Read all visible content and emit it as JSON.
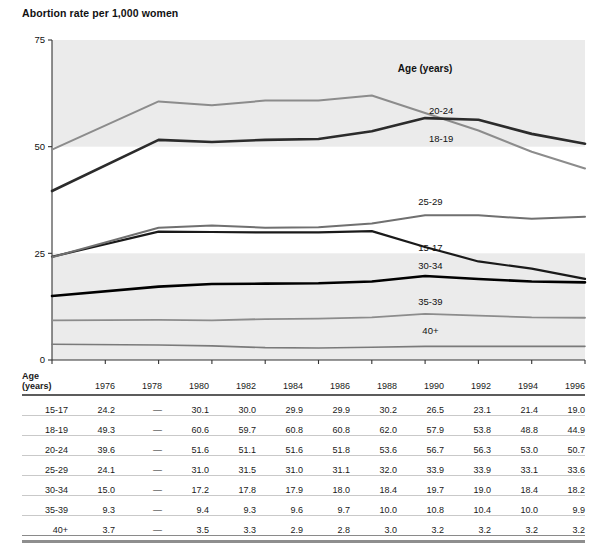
{
  "chart_data": {
    "type": "line",
    "title": "Abortion rate per 1,000 women",
    "xlabel": "",
    "ylabel": "",
    "ylim": [
      0,
      75
    ],
    "yticks": [
      0,
      25,
      50,
      75
    ],
    "grid": false,
    "bands": "alternating light-gray horizontal bands between y=0-25 and y=50-75",
    "legend_position": "inline-right",
    "legend_title": "Age (years)",
    "x": [
      1976,
      1978,
      1980,
      1982,
      1984,
      1986,
      1988,
      1990,
      1992,
      1994,
      1996
    ],
    "xticklabels": [
      "1976",
      "1978",
      "1980",
      "1982",
      "1984",
      "1986",
      "1988",
      "1990",
      "1992",
      "1994",
      "1996"
    ],
    "series": [
      {
        "name": "15-17",
        "color": "#1a1a1a",
        "width": 2.2,
        "values": [
          24.2,
          null,
          30.1,
          30.0,
          29.9,
          29.9,
          30.2,
          26.5,
          23.1,
          21.4,
          19.0
        ]
      },
      {
        "name": "18-19",
        "color": "#8c8c8c",
        "width": 2.0,
        "values": [
          49.3,
          null,
          60.6,
          59.7,
          60.8,
          60.8,
          62.0,
          57.9,
          53.8,
          48.8,
          44.9
        ]
      },
      {
        "name": "20-24",
        "color": "#2b2b2b",
        "width": 2.6,
        "values": [
          39.6,
          null,
          51.6,
          51.1,
          51.6,
          51.8,
          53.6,
          56.7,
          56.3,
          53.0,
          50.7
        ]
      },
      {
        "name": "25-29",
        "color": "#707070",
        "width": 2.0,
        "values": [
          24.1,
          null,
          31.0,
          31.5,
          31.0,
          31.1,
          32.0,
          33.9,
          33.9,
          33.1,
          33.6
        ]
      },
      {
        "name": "30-34",
        "color": "#000000",
        "width": 2.6,
        "values": [
          15.0,
          null,
          17.2,
          17.8,
          17.9,
          18.0,
          18.4,
          19.7,
          19.0,
          18.4,
          18.2
        ]
      },
      {
        "name": "35-39",
        "color": "#8c8c8c",
        "width": 1.8,
        "values": [
          9.3,
          null,
          9.4,
          9.3,
          9.6,
          9.7,
          10.0,
          10.8,
          10.4,
          10.0,
          9.9
        ]
      },
      {
        "name": "40+",
        "color": "#7a7a7a",
        "width": 1.6,
        "values": [
          3.7,
          null,
          3.5,
          3.3,
          2.9,
          2.8,
          3.0,
          3.2,
          3.2,
          3.2,
          3.2
        ]
      }
    ],
    "inline_labels": [
      {
        "text": "Age (years)",
        "x": 1990.0,
        "y": 67.5,
        "bold": true
      },
      {
        "text": "20-24",
        "x": 1990.6,
        "y": 57.6,
        "bold": false
      },
      {
        "text": "18-19",
        "x": 1990.6,
        "y": 51.0,
        "bold": false
      },
      {
        "text": "25-29",
        "x": 1990.2,
        "y": 36.3,
        "bold": false
      },
      {
        "text": "15-17",
        "x": 1990.2,
        "y": 25.5,
        "bold": false
      },
      {
        "text": "30-34",
        "x": 1990.2,
        "y": 21.4,
        "bold": false
      },
      {
        "text": "35-39",
        "x": 1990.2,
        "y": 12.8,
        "bold": false
      },
      {
        "text": "40+",
        "x": 1990.2,
        "y": 6.2,
        "bold": false
      }
    ]
  },
  "table": {
    "corner_header_line1": "Age",
    "corner_header_line2": "(years)",
    "columns": [
      "1976",
      "1978",
      "1980",
      "1982",
      "1984",
      "1986",
      "1988",
      "1990",
      "1992",
      "1994",
      "1996"
    ],
    "rows": [
      {
        "label": "15-17",
        "values": [
          "24.2",
          "—",
          "30.1",
          "30.0",
          "29.9",
          "29.9",
          "30.2",
          "26.5",
          "23.1",
          "21.4",
          "19.0"
        ]
      },
      {
        "label": "18-19",
        "values": [
          "49.3",
          "—",
          "60.6",
          "59.7",
          "60.8",
          "60.8",
          "62.0",
          "57.9",
          "53.8",
          "48.8",
          "44.9"
        ]
      },
      {
        "label": "20-24",
        "values": [
          "39.6",
          "—",
          "51.6",
          "51.1",
          "51.6",
          "51.8",
          "53.6",
          "56.7",
          "56.3",
          "53.0",
          "50.7"
        ]
      },
      {
        "label": "25-29",
        "values": [
          "24.1",
          "—",
          "31.0",
          "31.5",
          "31.0",
          "31.1",
          "32.0",
          "33.9",
          "33.9",
          "33.1",
          "33.6"
        ]
      },
      {
        "label": "30-34",
        "values": [
          "15.0",
          "—",
          "17.2",
          "17.8",
          "17.9",
          "18.0",
          "18.4",
          "19.7",
          "19.0",
          "18.4",
          "18.2"
        ]
      },
      {
        "label": "35-39",
        "values": [
          "9.3",
          "—",
          "9.4",
          "9.3",
          "9.6",
          "9.7",
          "10.0",
          "10.8",
          "10.4",
          "10.0",
          "9.9"
        ]
      },
      {
        "label": "40+",
        "values": [
          "3.7",
          "—",
          "3.5",
          "3.3",
          "2.9",
          "2.8",
          "3.0",
          "3.2",
          "3.2",
          "3.2",
          "3.2"
        ]
      }
    ]
  },
  "colors": {
    "band": "#ebebeb",
    "plot_background": "#ffffff",
    "axis": "#333333",
    "rule_dark": "#5c5c5c",
    "rule_light": "#c9c9c9",
    "text": "#111111"
  }
}
